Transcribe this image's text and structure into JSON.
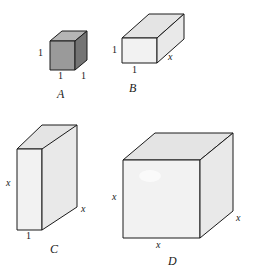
{
  "figure": {
    "background_color": "#ffffff",
    "edge_color": "#1a1a1a",
    "shapes": [
      {
        "id": "A",
        "name_label": "A",
        "description": "small shaded unit cube",
        "dimensions": [
          "1",
          "1",
          "1"
        ],
        "face_front_color": "#9a9a9a",
        "face_top_color": "#b5b5b5",
        "face_side_color": "#747474",
        "labels": {
          "height": "1",
          "width": "1",
          "depth": "1"
        }
      },
      {
        "id": "B",
        "name_label": "B",
        "description": "elongated rectangular prism",
        "dimensions": [
          "1",
          "1",
          "x"
        ],
        "face_front_color": "#f2f2f2",
        "face_top_color": "#e4e4e4",
        "face_side_color": "#e9e9e9",
        "labels": {
          "height": "1",
          "width": "1",
          "depth": "x"
        }
      },
      {
        "id": "C",
        "name_label": "C",
        "description": "tall thin slab",
        "dimensions": [
          "x",
          "1",
          "x"
        ],
        "face_front_color": "#f2f2f2",
        "face_top_color": "#e4e4e4",
        "face_side_color": "#e9e9e9",
        "labels": {
          "height": "x",
          "width": "1",
          "depth": "x"
        }
      },
      {
        "id": "D",
        "name_label": "D",
        "description": "large cube",
        "dimensions": [
          "x",
          "x",
          "x"
        ],
        "face_front_color": "#f2f2f2",
        "face_top_color": "#e4e4e4",
        "face_side_color": "#e9e9e9",
        "labels": {
          "height": "x",
          "width": "x",
          "depth": "x"
        }
      }
    ],
    "annotations": {
      "a_height": "1",
      "a_width": "1",
      "a_depth": "1",
      "a_name": "A",
      "b_height": "1",
      "b_width": "1",
      "b_depth": "x",
      "b_name": "B",
      "c_height": "x",
      "c_width": "1",
      "c_depth": "x",
      "c_name": "C",
      "d_height": "x",
      "d_width": "x",
      "d_depth": "x",
      "d_name": "D"
    }
  }
}
